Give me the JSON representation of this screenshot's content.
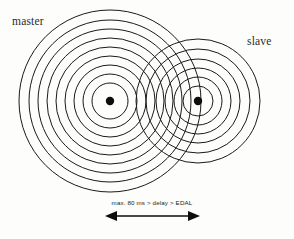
{
  "figure": {
    "title_master": "master",
    "title_slave": "slave",
    "range_caption": "max. 80 ms > delay > EDAL",
    "colors": {
      "stroke": "#1a1a1a",
      "dot": "#0d0d0d",
      "background": "#fdfdfc",
      "text": "#2a2a2a"
    }
  },
  "chart_data": {
    "type": "diagram",
    "title": "",
    "nodes": [
      {
        "id": "master",
        "label": "master",
        "center": [
          110,
          101
        ],
        "ring_radii": [
          18,
          27,
          36,
          45,
          54,
          63,
          72,
          81,
          91
        ],
        "label_position": [
          12,
          25
        ]
      },
      {
        "id": "slave",
        "label": "slave",
        "center": [
          198,
          101
        ],
        "ring_radii": [
          15,
          24,
          33,
          42,
          52,
          62
        ],
        "label_position": [
          247,
          45
        ]
      }
    ],
    "annotation": {
      "text": "max. 80 ms > delay > EDAL",
      "arrow": {
        "from_x": 105,
        "to_x": 200,
        "y": 216,
        "double_headed": true
      },
      "text_position": [
        152,
        205
      ]
    },
    "xlim": [
      0,
      294
    ],
    "ylim": [
      0,
      239
    ],
    "grid": false,
    "legend": "none"
  }
}
